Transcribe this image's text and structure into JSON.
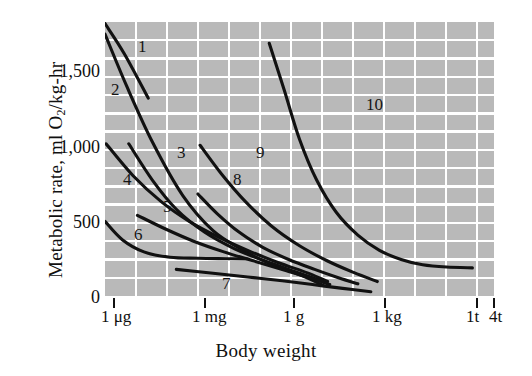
{
  "chart_data": {
    "type": "line",
    "title": "",
    "xlabel": "Body weight",
    "ylabel": "Metabolic rate, ml O₂/kg-hr",
    "ylabel_plain": "Metabolic rate, ml O2/kg-hr",
    "y_ticks": [
      0,
      500,
      1000,
      1500
    ],
    "y_tick_labels": [
      "0",
      "500",
      "1,000",
      "1,500"
    ],
    "ylim": [
      0,
      1800
    ],
    "x_tick_labels": [
      "1 μg",
      "1 mg",
      "1 g",
      "1 kg",
      "1t",
      "4t"
    ],
    "x_scale": "log (body weight)",
    "grid": true,
    "grid_color": "#ffffff",
    "plot_background": "#b9b9b9",
    "line_color": "#111111",
    "legend_position": "inline curve numbers",
    "series": [
      {
        "name": "1",
        "label": "1",
        "points": [
          [
            0.0,
            1790
          ],
          [
            0.9,
            1590
          ],
          [
            2.0,
            1300
          ]
        ]
      },
      {
        "name": "2",
        "label": "2",
        "points": [
          [
            0.0,
            1720
          ],
          [
            1.0,
            1380
          ],
          [
            2.2,
            1010
          ],
          [
            3.6,
            660
          ],
          [
            5.0,
            430
          ],
          [
            6.4,
            300
          ],
          [
            7.6,
            215
          ],
          [
            9.0,
            140
          ],
          [
            10.1,
            70
          ]
        ]
      },
      {
        "name": "3",
        "label": "3",
        "points": [
          [
            1.1,
            1000
          ],
          [
            2.2,
            760
          ],
          [
            3.3,
            570
          ],
          [
            4.6,
            420
          ],
          [
            6.0,
            310
          ],
          [
            7.4,
            230
          ],
          [
            8.8,
            160
          ],
          [
            10.0,
            100
          ]
        ]
      },
      {
        "name": "4",
        "label": "4",
        "points": [
          [
            0.05,
            1000
          ],
          [
            1.3,
            790
          ],
          [
            2.6,
            620
          ],
          [
            3.9,
            490
          ],
          [
            5.2,
            390
          ],
          [
            6.6,
            300
          ],
          [
            8.0,
            220
          ],
          [
            9.4,
            150
          ],
          [
            10.3,
            95
          ]
        ]
      },
      {
        "name": "5",
        "label": "5",
        "points": [
          [
            1.5,
            530
          ],
          [
            2.8,
            440
          ],
          [
            4.1,
            360
          ],
          [
            5.5,
            290
          ],
          [
            7.0,
            225
          ],
          [
            8.4,
            165
          ],
          [
            9.6,
            115
          ],
          [
            10.4,
            75
          ]
        ]
      },
      {
        "name": "6",
        "label": "6",
        "points": [
          [
            0.0,
            490
          ],
          [
            0.8,
            370
          ],
          [
            1.8,
            290
          ],
          [
            3.0,
            255
          ],
          [
            4.3,
            248
          ],
          [
            5.6,
            245
          ],
          [
            6.6,
            243
          ]
        ]
      },
      {
        "name": "7",
        "label": "7",
        "points": [
          [
            3.3,
            175
          ],
          [
            5.0,
            150
          ],
          [
            6.6,
            125
          ],
          [
            8.2,
            100
          ],
          [
            9.6,
            75
          ],
          [
            11.0,
            50
          ],
          [
            12.3,
            28
          ]
        ]
      },
      {
        "name": "8",
        "label": "8",
        "points": [
          [
            4.3,
            670
          ],
          [
            5.2,
            540
          ],
          [
            6.2,
            420
          ],
          [
            7.3,
            320
          ],
          [
            8.5,
            240
          ],
          [
            9.7,
            175
          ],
          [
            10.8,
            120
          ],
          [
            11.7,
            80
          ]
        ]
      },
      {
        "name": "9",
        "label": "9",
        "points": [
          [
            4.4,
            990
          ],
          [
            5.4,
            800
          ],
          [
            6.5,
            620
          ],
          [
            7.7,
            460
          ],
          [
            9.0,
            330
          ],
          [
            10.3,
            230
          ],
          [
            11.5,
            155
          ],
          [
            12.6,
            95
          ]
        ]
      },
      {
        "name": "10",
        "label": "10",
        "points": [
          [
            7.6,
            1660
          ],
          [
            8.3,
            1350
          ],
          [
            9.0,
            1030
          ],
          [
            9.8,
            760
          ],
          [
            10.7,
            550
          ],
          [
            11.7,
            400
          ],
          [
            12.7,
            300
          ],
          [
            13.7,
            240
          ],
          [
            14.7,
            205
          ],
          [
            15.8,
            190
          ],
          [
            17.0,
            185
          ]
        ]
      }
    ],
    "curve_labels": [
      {
        "text": "1",
        "x": 138,
        "y": 52
      },
      {
        "text": "2",
        "x": 111,
        "y": 95
      },
      {
        "text": "3",
        "x": 177,
        "y": 158
      },
      {
        "text": "4",
        "x": 123,
        "y": 185
      },
      {
        "text": "5",
        "x": 163,
        "y": 212
      },
      {
        "text": "6",
        "x": 134,
        "y": 240
      },
      {
        "text": "7",
        "x": 222,
        "y": 289
      },
      {
        "text": "8",
        "x": 233,
        "y": 185
      },
      {
        "text": "9",
        "x": 256,
        "y": 158
      },
      {
        "text": "10",
        "x": 366,
        "y": 110
      }
    ]
  },
  "axes": {
    "y_title": "Metabolic rate, ml O",
    "y_title_sub": "2",
    "y_title_rest": "/kg-hr",
    "x_title": "Body weight",
    "y_tick_0": "0",
    "y_tick_500": "500",
    "y_tick_1000": "1,000",
    "y_tick_1500": "1,500",
    "x_tick_1": "1",
    "x_tick_1_unit": "μg",
    "x_tick_2": "1",
    "x_tick_2_unit": "mg",
    "x_tick_3": "1",
    "x_tick_3_unit": "g",
    "x_tick_4": "1",
    "x_tick_4_unit": "kg",
    "x_tick_5": "1t",
    "x_tick_6": "4t"
  }
}
